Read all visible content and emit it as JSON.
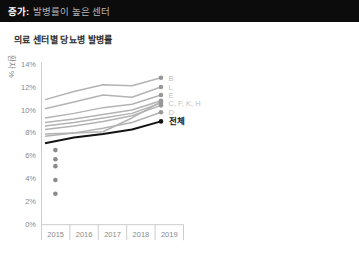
{
  "header": {
    "prefix": "증가:",
    "title": "발병률이 높은 센터",
    "bar_color": "#0c0c0c",
    "prefix_color": "#ffffff",
    "title_color": "#b5b5b5"
  },
  "chart": {
    "title": "의료 센터별 당뇨병 발병률"
  },
  "chart_data": {
    "type": "line",
    "title": "의료 센터별 당뇨병 발병률",
    "xlabel": "",
    "ylabel": "환자 %",
    "x": [
      "2015",
      "2016",
      "2017",
      "2018",
      "2019"
    ],
    "ylim": [
      0,
      14
    ],
    "ytick_labels": [
      "0%",
      "2%",
      "4%",
      "6%",
      "8%",
      "10%",
      "12%",
      "14%"
    ],
    "grid": false,
    "legend_position": "end-of-line-labels",
    "series": [
      {
        "name": "B",
        "values": [
          10.9,
          11.6,
          12.2,
          12.1,
          12.8
        ],
        "emphasis": false
      },
      {
        "name": "L",
        "values": [
          10.1,
          10.7,
          11.3,
          11.1,
          12.0
        ],
        "emphasis": false
      },
      {
        "name": "E",
        "values": [
          9.3,
          9.7,
          10.2,
          10.5,
          11.3
        ],
        "emphasis": false
      },
      {
        "name": "C",
        "values": [
          8.9,
          9.2,
          9.6,
          10.0,
          10.8
        ],
        "emphasis": false
      },
      {
        "name": "F",
        "values": [
          8.6,
          8.9,
          9.3,
          9.7,
          10.6
        ],
        "emphasis": false
      },
      {
        "name": "K",
        "values": [
          7.9,
          8.0,
          8.1,
          9.3,
          10.7
        ],
        "emphasis": false
      },
      {
        "name": "H",
        "values": [
          8.3,
          8.6,
          9.0,
          9.5,
          10.4
        ],
        "emphasis": false
      },
      {
        "name": "D",
        "values": [
          7.7,
          8.0,
          8.4,
          8.9,
          9.8
        ],
        "emphasis": false
      },
      {
        "name": "전체",
        "values": [
          7.1,
          7.6,
          7.9,
          8.3,
          9.0
        ],
        "emphasis": true
      }
    ],
    "isolated_points": {
      "x": "2015",
      "values": [
        6.5,
        5.7,
        5.1,
        3.9,
        2.7
      ]
    },
    "end_labels": [
      {
        "text": "B",
        "value": 12.8
      },
      {
        "text": "L",
        "value": 12.0
      },
      {
        "text": "E",
        "value": 11.3
      },
      {
        "text": "C, F, K, H",
        "value": 10.6
      },
      {
        "text": "D",
        "value": 9.8
      },
      {
        "text": "전체",
        "value": 9.0,
        "emphasis": true
      }
    ],
    "colors": {
      "line_gray": "#b3b3b3",
      "marker_gray": "#979797",
      "isolated_dot": "#8a8a8a",
      "axis": "#cccccc",
      "tick_text": "#8a8a8a",
      "end_label_gray": "#c2c2c2",
      "emphasis": "#141414"
    }
  }
}
